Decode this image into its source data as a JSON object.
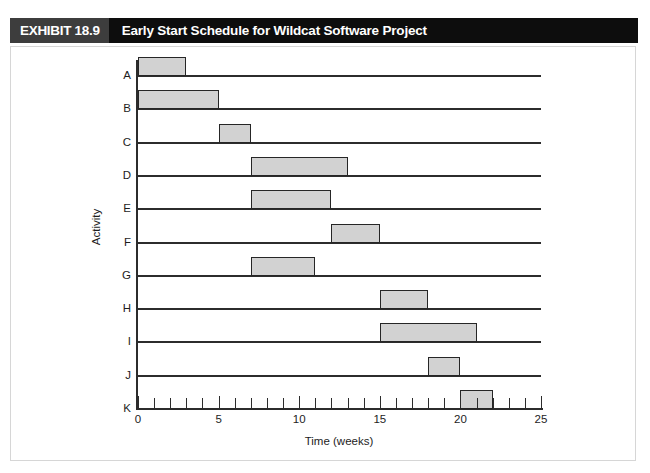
{
  "exhibit": {
    "number_label": "EXHIBIT 18.9",
    "title": "Early Start Schedule for Wildcat Software Project"
  },
  "chart_data": {
    "type": "bar",
    "orientation": "horizontal",
    "subtype": "gantt",
    "title": "Early Start Schedule for Wildcat Software Project",
    "xlabel": "Time (weeks)",
    "ylabel": "Activity",
    "xlim": [
      0,
      25
    ],
    "x_major_ticks": [
      0,
      5,
      10,
      15,
      20,
      25
    ],
    "x_major_tick_labels": [
      "0",
      "5",
      "10",
      "15",
      "20",
      "25"
    ],
    "x_minor_tick_interval": 1,
    "grid": "horizontal-row-lines",
    "legend": "none",
    "categories": [
      "A",
      "B",
      "C",
      "D",
      "E",
      "F",
      "G",
      "H",
      "I",
      "J",
      "K"
    ],
    "bar_fill_color": "#d2d2d2",
    "bar_border_color": "#262626",
    "tasks": [
      {
        "activity": "A",
        "start": 0,
        "finish": 3,
        "duration": 3
      },
      {
        "activity": "B",
        "start": 0,
        "finish": 5,
        "duration": 5
      },
      {
        "activity": "C",
        "start": 5,
        "finish": 7,
        "duration": 2
      },
      {
        "activity": "D",
        "start": 7,
        "finish": 13,
        "duration": 6
      },
      {
        "activity": "E",
        "start": 7,
        "finish": 12,
        "duration": 5
      },
      {
        "activity": "F",
        "start": 12,
        "finish": 15,
        "duration": 3
      },
      {
        "activity": "G",
        "start": 7,
        "finish": 11,
        "duration": 4
      },
      {
        "activity": "H",
        "start": 15,
        "finish": 18,
        "duration": 3
      },
      {
        "activity": "I",
        "start": 15,
        "finish": 21,
        "duration": 6
      },
      {
        "activity": "J",
        "start": 18,
        "finish": 20,
        "duration": 2
      },
      {
        "activity": "K",
        "start": 20,
        "finish": 22,
        "duration": 2
      }
    ]
  },
  "colors": {
    "banner_background": "#0d0d0d",
    "banner_number_background": "#3d3d3d",
    "banner_text": "#ffffff",
    "axis": "#2c2c2c",
    "page_border": "#d6d6d6"
  }
}
